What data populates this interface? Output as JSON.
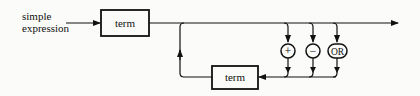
{
  "diagram": {
    "type": "syntax-diagram",
    "entry_label_line1": "simple",
    "entry_label_line2": "expression",
    "first_term": "term",
    "loop_term": "term",
    "operators": [
      "+",
      "−",
      "OR"
    ],
    "line_color": "#111111",
    "background": "#fbfbf9"
  }
}
